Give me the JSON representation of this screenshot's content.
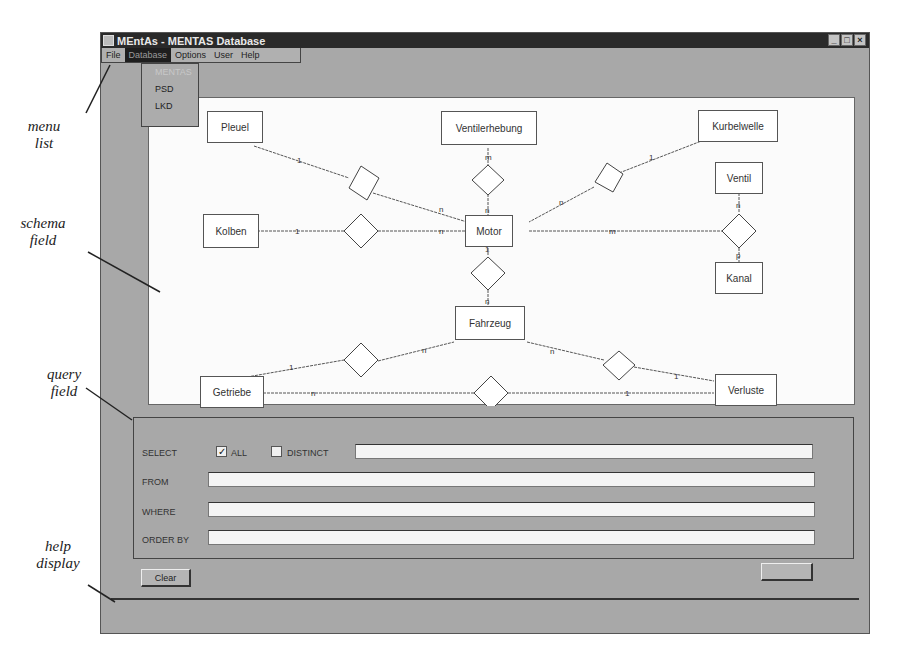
{
  "window": {
    "title": "MEntAs - MENTAS Database",
    "controls": [
      "minimize",
      "maximize",
      "close"
    ]
  },
  "menu": {
    "items": [
      {
        "label": "File"
      },
      {
        "label": "Database",
        "active": true
      },
      {
        "label": "Options"
      },
      {
        "label": "User"
      },
      {
        "label": "Help"
      }
    ],
    "dropdown": [
      {
        "label": "MENTAS",
        "disabled": true
      },
      {
        "label": "PSD"
      },
      {
        "label": "LKD"
      }
    ]
  },
  "callouts": {
    "menu_list": [
      "menu",
      "list"
    ],
    "schema_field": [
      "schema",
      "field"
    ],
    "query_field": [
      "query",
      "field"
    ],
    "help_display": [
      "help",
      "display"
    ]
  },
  "schema": {
    "entities": [
      {
        "id": "pleuel",
        "label": "Pleuel"
      },
      {
        "id": "ventilerhebung",
        "label": "Ventilerhebung"
      },
      {
        "id": "kurbelwelle",
        "label": "Kurbelwelle"
      },
      {
        "id": "ventil",
        "label": "Ventil"
      },
      {
        "id": "kolben",
        "label": "Kolben"
      },
      {
        "id": "motor",
        "label": "Motor"
      },
      {
        "id": "kanal",
        "label": "Kanal"
      },
      {
        "id": "fahrzeug",
        "label": "Fahrzeug"
      },
      {
        "id": "getriebe",
        "label": "Getriebe"
      },
      {
        "id": "verluste",
        "label": "Verluste"
      }
    ],
    "relationships": [
      {
        "between": [
          "Pleuel",
          "Motor"
        ],
        "cardinality": [
          "1",
          "n"
        ]
      },
      {
        "between": [
          "Ventilerhebung",
          "Motor"
        ],
        "cardinality": [
          "m",
          "n"
        ]
      },
      {
        "between": [
          "Kurbelwelle",
          "Motor"
        ],
        "cardinality": [
          "1",
          "n"
        ]
      },
      {
        "between": [
          "Kolben",
          "Motor"
        ],
        "cardinality": [
          "1",
          "n"
        ]
      },
      {
        "between": [
          "Motor",
          "Ventil",
          "Kanal"
        ],
        "cardinality": [
          "m",
          "n",
          "p"
        ]
      },
      {
        "between": [
          "Motor",
          "Fahrzeug"
        ],
        "cardinality": [
          "1",
          "n"
        ]
      },
      {
        "between": [
          "Getriebe",
          "Fahrzeug"
        ],
        "cardinality": [
          "1",
          "n"
        ]
      },
      {
        "between": [
          "Fahrzeug",
          "Verluste"
        ],
        "cardinality": [
          "n",
          "1"
        ]
      },
      {
        "between": [
          "Getriebe",
          "Verluste"
        ],
        "cardinality": [
          "n",
          "1"
        ]
      }
    ]
  },
  "query": {
    "select_label": "SELECT",
    "all_label": "ALL",
    "all_checked": true,
    "distinct_label": "DISTINCT",
    "distinct_checked": false,
    "select_value": "",
    "from_label": "FROM",
    "from_value": "",
    "where_label": "WHERE",
    "where_value": "",
    "order_by_label": "ORDER BY",
    "order_by_value": ""
  },
  "buttons": {
    "clear": "Clear",
    "right": ""
  },
  "help": {
    "text": ""
  }
}
